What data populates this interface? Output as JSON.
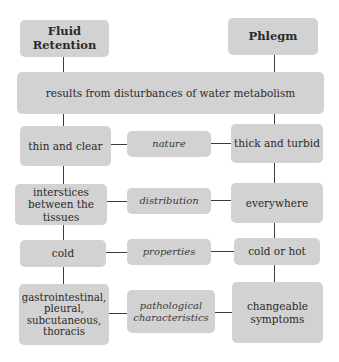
{
  "diagram": {
    "left_header": "Fluid\nRetention",
    "left_header_lines": [
      "Fluid",
      "Retention"
    ],
    "right_header": "Phlegm",
    "shared": "results from disturbances of water metabolism",
    "rows": [
      {
        "left_lines": [
          "thin and clear"
        ],
        "middle_lines": [
          "nature"
        ],
        "right_lines": [
          "thick and turbid"
        ]
      },
      {
        "left_lines": [
          "interstices",
          "between the",
          "tissues"
        ],
        "middle_lines": [
          "distribution"
        ],
        "right_lines": [
          "everywhere"
        ]
      },
      {
        "left_lines": [
          "cold"
        ],
        "middle_lines": [
          "properties"
        ],
        "right_lines": [
          "cold or hot"
        ]
      },
      {
        "left_lines": [
          "gastrointestinal,",
          "pleural,",
          "subcutaneous,",
          "thoracis"
        ],
        "middle_lines": [
          "pathological",
          "characteristics"
        ],
        "right_lines": [
          "changeable",
          "symptoms"
        ]
      }
    ]
  },
  "colors": {
    "box_fill": "#d2d2d2",
    "connector": "#3c3c3c",
    "text": "#2a2a2a"
  }
}
